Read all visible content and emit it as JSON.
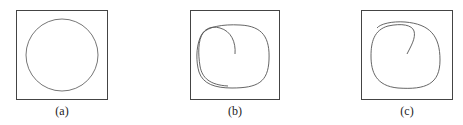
{
  "figure": {
    "panels": [
      {
        "label": "(a)",
        "description": "circle"
      },
      {
        "label": "(b)",
        "description": "spiral-curve"
      },
      {
        "label": "(c)",
        "description": "spiral-curve"
      }
    ],
    "colors": {
      "stroke": "#555555",
      "frame": "#444444"
    }
  }
}
